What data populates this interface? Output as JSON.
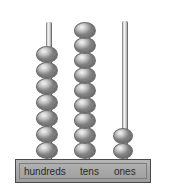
{
  "figure": {
    "background_color": "#ffffff"
  },
  "base": {
    "color": "#a9a9a9",
    "border_color": "#4a4a4a",
    "labels": [
      {
        "name": "hundreds",
        "text": "hundreds"
      },
      {
        "name": "tens",
        "text": "tens"
      },
      {
        "name": "ones",
        "text": "ones"
      }
    ]
  },
  "columns": [
    {
      "name": "hundreds",
      "label": "hundreds",
      "bead_count": 7,
      "rod_left": 46,
      "rod_top": 22,
      "rod_height": 138,
      "bead_left": 36,
      "bead_bottom_y": 159,
      "bead_step": 16
    },
    {
      "name": "tens",
      "label": "tens",
      "bead_count": 9,
      "rod_left": 84,
      "rod_top": 24,
      "rod_height": 136,
      "bead_left": 74,
      "bead_bottom_y": 159,
      "bead_step": 15
    },
    {
      "name": "ones",
      "label": "ones",
      "bead_count": 2,
      "rod_left": 122,
      "rod_top": 21,
      "rod_height": 139,
      "bead_left": 113,
      "bead_bottom_y": 159,
      "bead_step": 15
    }
  ],
  "colors": {
    "bead_fill": "#b9b9b9",
    "bead_highlight": "#f4f4f4",
    "bead_border": "#6f6f6f",
    "rod": "#d8d8d8",
    "text": "#2a2a2a"
  }
}
